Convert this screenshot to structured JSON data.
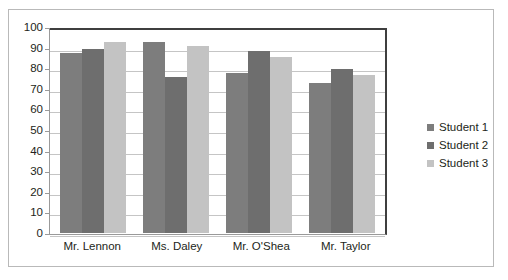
{
  "chart_data": {
    "type": "bar",
    "title": "",
    "xlabel": "",
    "ylabel": "",
    "ylim": [
      0,
      100
    ],
    "ytick_step": 10,
    "yticks": [
      "100",
      "90",
      "80",
      "70",
      "60",
      "50",
      "40",
      "30",
      "20",
      "10",
      "0"
    ],
    "grid": true,
    "legend_position": "right",
    "categories": [
      "Mr. Lennon",
      "Ms. Daley",
      "Mr. O'Shea",
      "Mr. Taylor"
    ],
    "series": [
      {
        "name": "Student 1",
        "color": "#7d7d7d",
        "values": [
          88,
          93,
          78,
          73
        ]
      },
      {
        "name": "Student 2",
        "color": "#6e6e6e",
        "values": [
          90,
          76,
          89,
          80
        ]
      },
      {
        "name": "Student 3",
        "color": "#c3c3c3",
        "values": [
          93,
          91,
          86,
          77
        ]
      }
    ]
  }
}
